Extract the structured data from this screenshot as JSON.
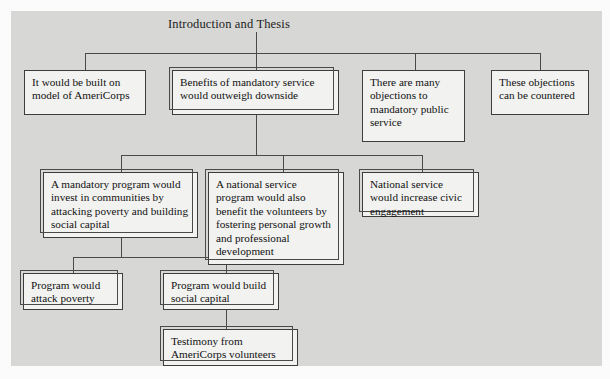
{
  "diagram": {
    "type": "tree-outline-flowchart",
    "title": "Introduction and Thesis",
    "background_color": "#d7d7d5",
    "node_fill_color": "#f2f2f0",
    "node_border_color": "#3d3d3d",
    "connector_color": "#4a4a4a",
    "nodes": [
      {
        "id": "root",
        "label": "Introduction and Thesis"
      },
      {
        "id": "americorps",
        "label": "It would be built on model of AmeriCorps"
      },
      {
        "id": "benefits",
        "label": "Benefits of mandatory service would outweigh downside"
      },
      {
        "id": "objections",
        "label": "There are many objections to mandatory public service"
      },
      {
        "id": "countered",
        "label": "These objections can be countered"
      },
      {
        "id": "invest",
        "label": "A mandatory program would invest in communities by attacking poverty and building social capital"
      },
      {
        "id": "volunteers",
        "label": "A national service program would also benefit the volunteers by fostering personal growth and professional development"
      },
      {
        "id": "civic",
        "label": "National service would increase civic engagement"
      },
      {
        "id": "attack",
        "label": "Program would attack poverty"
      },
      {
        "id": "build",
        "label": "Program would build social capital"
      },
      {
        "id": "testimony",
        "label": "Testimony from AmeriCorps volunteers"
      }
    ],
    "edges": [
      {
        "from": "root",
        "to": "americorps"
      },
      {
        "from": "root",
        "to": "benefits"
      },
      {
        "from": "root",
        "to": "objections"
      },
      {
        "from": "root",
        "to": "countered"
      },
      {
        "from": "benefits",
        "to": "invest"
      },
      {
        "from": "benefits",
        "to": "volunteers"
      },
      {
        "from": "benefits",
        "to": "civic"
      },
      {
        "from": "invest",
        "to": "attack"
      },
      {
        "from": "invest",
        "to": "build"
      },
      {
        "from": "build",
        "to": "testimony"
      }
    ]
  }
}
